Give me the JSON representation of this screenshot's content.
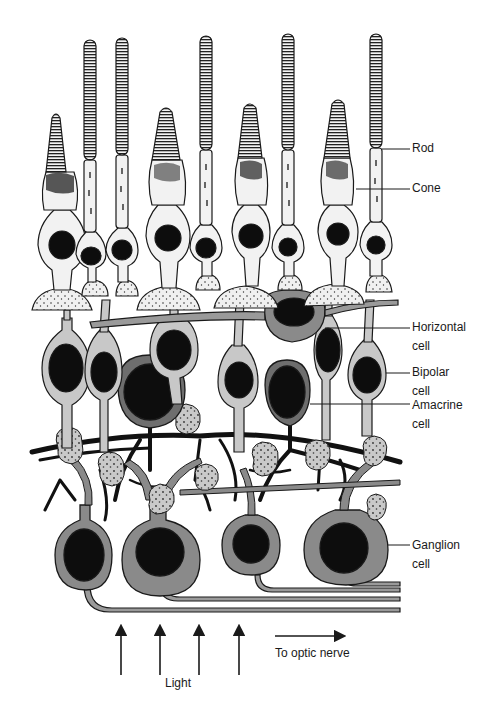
{
  "diagram": {
    "colors": {
      "outline": "#1a1a1a",
      "cell_fill_light": "#f2f2f2",
      "cell_fill_mid": "#c8c8c8",
      "cell_fill_gray": "#8a8a8a",
      "nucleus": "#0d0d0d",
      "background": "#ffffff"
    },
    "labels": [
      {
        "id": "rod",
        "text": "Rod"
      },
      {
        "id": "cone",
        "text": "Cone"
      },
      {
        "id": "horizontal",
        "text": "Horizontal\ncell"
      },
      {
        "id": "bipolar",
        "text": "Bipolar\ncell"
      },
      {
        "id": "amacrine",
        "text": "Amacrine\ncell"
      },
      {
        "id": "ganglion",
        "text": "Ganglion\ncell"
      }
    ],
    "bottom": {
      "light_label": "Light",
      "optic_label": "To optic nerve",
      "light_arrow_count": 4
    },
    "photoreceptors": {
      "rods": 5,
      "cones": 4
    }
  }
}
